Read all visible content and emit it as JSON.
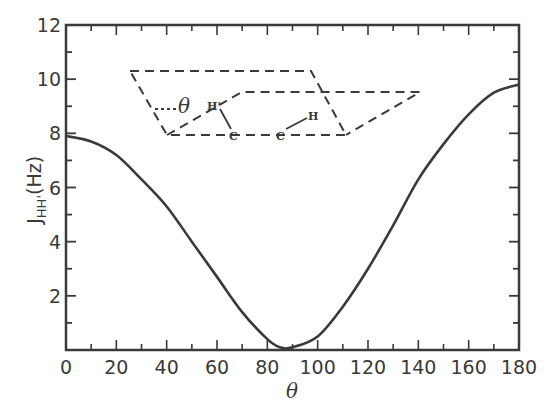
{
  "chart_data": {
    "type": "line",
    "title": "",
    "xlabel": "θ",
    "ylabel": "J_HH' (Hz)",
    "ylabel_main": "J",
    "ylabel_sub": "HH'",
    "ylabel_unit": "(Hz)",
    "xlim": [
      0,
      180
    ],
    "ylim": [
      0,
      12
    ],
    "grid": false,
    "legend": null,
    "x_ticks": [
      0,
      20,
      40,
      60,
      80,
      100,
      120,
      140,
      160,
      180
    ],
    "y_ticks": [
      2,
      4,
      6,
      8,
      10,
      12
    ],
    "x_minor_step": 10,
    "y_minor_step": 1,
    "series": [
      {
        "name": "Karplus curve",
        "x": [
          0,
          10,
          20,
          30,
          40,
          50,
          60,
          70,
          80,
          85,
          90,
          100,
          110,
          120,
          130,
          140,
          150,
          160,
          170,
          180
        ],
        "values": [
          7.9,
          7.7,
          7.2,
          6.3,
          5.3,
          4.0,
          2.7,
          1.4,
          0.4,
          0.1,
          0.1,
          0.5,
          1.6,
          3.0,
          4.6,
          6.3,
          7.6,
          8.7,
          9.5,
          9.8
        ]
      }
    ],
    "annotations": [
      {
        "type": "inset-diagram",
        "description": "Dihedral angle θ between H'-C-C and C-C-H planes (dashed parallelograms)"
      }
    ]
  },
  "inset": {
    "theta": "θ",
    "h_prime": "H'",
    "h": "H",
    "c1": "C",
    "c2": "C"
  }
}
